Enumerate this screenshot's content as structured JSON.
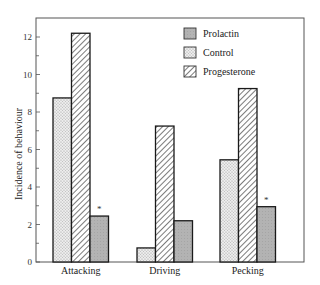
{
  "chart_data": {
    "type": "bar",
    "title": "",
    "xlabel": "",
    "ylabel": "Incidence of behaviour",
    "ylim": [
      0,
      13
    ],
    "yticks": [
      0,
      2,
      4,
      6,
      8,
      10,
      12
    ],
    "grid": false,
    "legend_position": "upper right (inside)",
    "categories": [
      "Attacking",
      "Driving",
      "Pecking"
    ],
    "series": [
      {
        "name": "Control",
        "pattern": "dotted",
        "color": "#e6e6e6",
        "values": [
          8.75,
          0.75,
          5.45
        ]
      },
      {
        "name": "Progesterone",
        "pattern": "hatched",
        "color": "#ffffff",
        "values": [
          12.2,
          7.25,
          9.25
        ]
      },
      {
        "name": "Prolactin",
        "pattern": "solid-grey",
        "color": "#b0b0b0",
        "values": [
          2.45,
          2.2,
          2.95
        ]
      }
    ],
    "legend_order": [
      "Prolactin",
      "Control",
      "Progesterone"
    ],
    "annotations": [
      {
        "text": "*",
        "category": "Attacking",
        "series": "Prolactin"
      },
      {
        "text": "*",
        "category": "Pecking",
        "series": "Prolactin"
      }
    ]
  }
}
